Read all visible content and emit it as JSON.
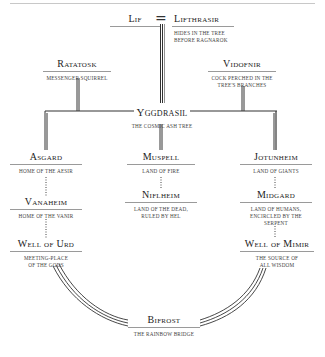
{
  "diagram": {
    "title": "Yggdrasil",
    "connector_symbol": "=",
    "nodes": {
      "lif": {
        "name": "Lif"
      },
      "lifthrasir": {
        "name": "Lifthrasir",
        "desc": "Hides in the tree before Ragnarok"
      },
      "ratatosk": {
        "name": "Ratatosk",
        "desc": "Messenger squirrel"
      },
      "vidofnir": {
        "name": "Vidofnir",
        "desc": "Cock perched in the tree's branches"
      },
      "yggdrasil": {
        "name": "Yggdrasil",
        "desc": "The cosmic ash tree"
      },
      "asgard": {
        "name": "Asgard",
        "desc": "Home of the Aesir"
      },
      "muspell": {
        "name": "Muspell",
        "desc": "Land of fire"
      },
      "jotunheim": {
        "name": "Jotunheim",
        "desc": "Land of giants"
      },
      "vanaheim": {
        "name": "Vanaheim",
        "desc": "Home of the Vanir"
      },
      "niflheim": {
        "name": "Niflheim",
        "desc": "Land of the dead, ruled by Hel"
      },
      "midgard": {
        "name": "Midgard",
        "desc": "Land of humans, encircled by the serpent"
      },
      "well_of_urd": {
        "name": "Well of Urd",
        "desc": "Meeting-place of the gods"
      },
      "well_of_mimir": {
        "name": "Well of Mimir",
        "desc": "The source of all wisdom"
      },
      "bifrost": {
        "name": "Bifrost",
        "desc": "The rainbow bridge"
      }
    },
    "colors": {
      "line": "#333333",
      "rule": "#9a9a9a",
      "text": "#222222"
    }
  }
}
